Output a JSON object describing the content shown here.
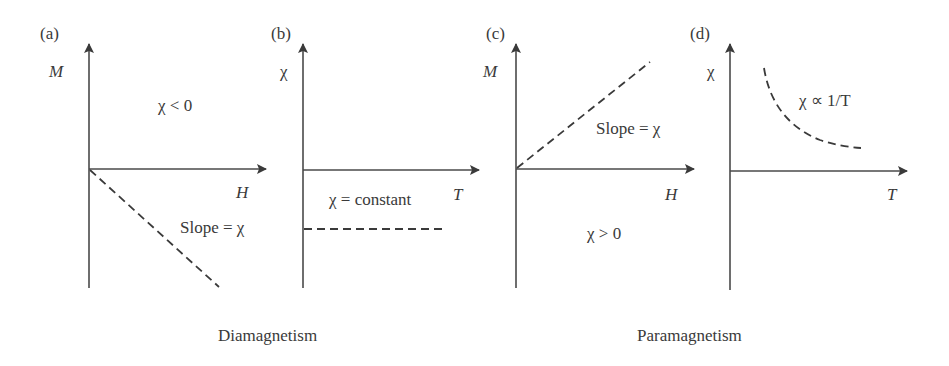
{
  "panels": [
    {
      "id": "a",
      "tag": "(a)",
      "y_axis": "M",
      "x_axis": "H",
      "annotations": [
        "χ < 0",
        "Slope = χ"
      ],
      "curve": "line through origin with negative slope (dashed)"
    },
    {
      "id": "b",
      "tag": "(b)",
      "y_axis": "χ",
      "x_axis": "T",
      "annotations": [
        "χ = constant"
      ],
      "curve": "horizontal dashed line below T axis"
    },
    {
      "id": "c",
      "tag": "(c)",
      "y_axis": "M",
      "x_axis": "H",
      "annotations": [
        "Slope = χ",
        "χ > 0"
      ],
      "curve": "line through origin with positive slope (dashed)"
    },
    {
      "id": "d",
      "tag": "(d)",
      "y_axis": "χ",
      "x_axis": "T",
      "annotations": [
        "χ ∝ 1/T"
      ],
      "curve": "decaying hyperbola (dashed)"
    }
  ],
  "captions": {
    "left": "Diamagnetism",
    "right": "Paramagnetism"
  },
  "colors": {
    "ink": "#3a3a3a",
    "background": "#ffffff"
  }
}
